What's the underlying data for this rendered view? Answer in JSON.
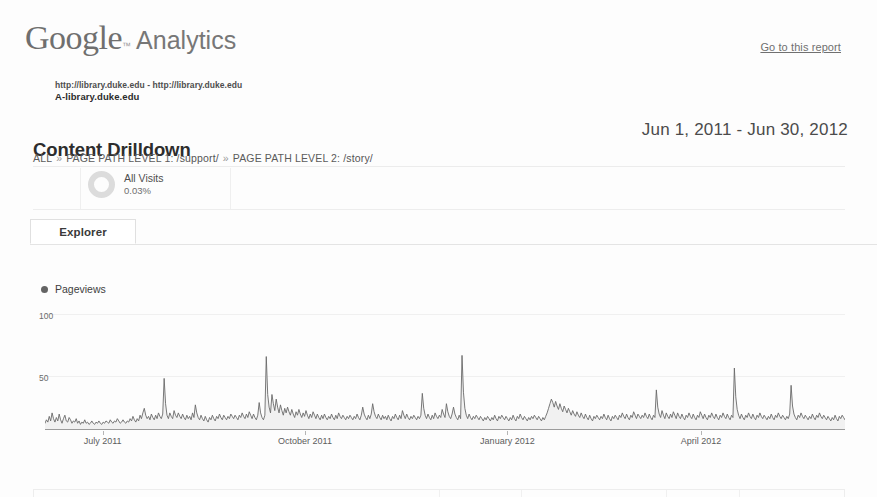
{
  "brand": {
    "logo_google": "Google",
    "logo_trademark": "™",
    "logo_product": "Analytics",
    "go_to_report_label": "Go to this report"
  },
  "property": {
    "line1": "http://library.duke.edu - http://library.duke.edu",
    "line2": "A-library.duke.edu"
  },
  "report": {
    "title": "Content Drilldown",
    "date_range": "Jun 1, 2011 - Jun 30, 2012"
  },
  "breadcrumb": {
    "root": "ALL",
    "separator": "»",
    "items": [
      {
        "label": "PAGE PATH LEVEL 1:",
        "value": "/support/"
      },
      {
        "label": "PAGE PATH LEVEL 2:",
        "value": "/story/"
      }
    ]
  },
  "segment": {
    "icon": "donut-chart-icon",
    "name": "All Visits",
    "percent": "0.03%"
  },
  "tabs": [
    {
      "label": "Explorer",
      "active": true
    }
  ],
  "chart_data": {
    "type": "line",
    "title": "",
    "subtitle": "",
    "xlabel": "",
    "ylabel": "",
    "legend": [
      {
        "name": "Pageviews",
        "color": "#646464"
      }
    ],
    "legend_position": "top-left",
    "grid": true,
    "ylim": [
      0,
      100
    ],
    "yticks": [
      50,
      100
    ],
    "ytick_labels": [
      "50",
      "100"
    ],
    "xtick_labels": [
      "July 2011",
      "October 2011",
      "January 2012",
      "April 2012"
    ],
    "xtick_positions": [
      0.072,
      0.325,
      0.578,
      0.82
    ],
    "x_start": "Jun 1, 2011",
    "x_end": "Jun 30, 2012",
    "x_interval": "daily",
    "series": [
      {
        "name": "Pageviews",
        "color": "#646464",
        "fill": "#f0f0f0",
        "values": [
          5,
          8,
          6,
          11,
          7,
          14,
          9,
          6,
          10,
          7,
          13,
          8,
          5,
          9,
          12,
          7,
          6,
          10,
          8,
          5,
          7,
          6,
          9,
          5,
          7,
          4,
          6,
          5,
          8,
          5,
          6,
          4,
          5,
          7,
          5,
          4,
          6,
          5,
          7,
          5,
          4,
          6,
          5,
          7,
          6,
          5,
          8,
          6,
          5,
          7,
          6,
          9,
          7,
          5,
          6,
          8,
          6,
          5,
          7,
          6,
          9,
          7,
          11,
          8,
          6,
          9,
          7,
          12,
          9,
          14,
          18,
          12,
          9,
          11,
          8,
          13,
          10,
          8,
          12,
          9,
          14,
          11,
          9,
          13,
          44,
          22,
          12,
          9,
          14,
          11,
          9,
          16,
          12,
          10,
          14,
          11,
          9,
          13,
          10,
          8,
          12,
          9,
          11,
          8,
          14,
          10,
          21,
          14,
          10,
          8,
          12,
          9,
          7,
          11,
          8,
          6,
          10,
          8,
          12,
          9,
          7,
          11,
          9,
          13,
          10,
          8,
          12,
          10,
          8,
          11,
          9,
          13,
          11,
          9,
          12,
          10,
          8,
          12,
          10,
          14,
          11,
          9,
          13,
          10,
          15,
          12,
          9,
          13,
          10,
          8,
          12,
          23,
          14,
          10,
          8,
          12,
          63,
          30,
          19,
          14,
          30,
          22,
          16,
          26,
          19,
          14,
          21,
          16,
          12,
          18,
          14,
          19,
          15,
          12,
          17,
          13,
          10,
          15,
          12,
          17,
          13,
          10,
          14,
          11,
          16,
          12,
          9,
          13,
          10,
          15,
          12,
          9,
          13,
          10,
          8,
          12,
          9,
          13,
          10,
          8,
          11,
          9,
          13,
          10,
          8,
          12,
          9,
          14,
          11,
          9,
          12,
          10,
          8,
          11,
          9,
          12,
          10,
          8,
          11,
          9,
          13,
          10,
          8,
          12,
          19,
          13,
          10,
          8,
          12,
          9,
          13,
          22,
          15,
          11,
          9,
          13,
          10,
          8,
          12,
          9,
          11,
          8,
          12,
          9,
          7,
          11,
          9,
          13,
          10,
          8,
          12,
          9,
          16,
          12,
          9,
          13,
          10,
          8,
          11,
          9,
          12,
          10,
          8,
          11,
          9,
          12,
          31,
          18,
          12,
          9,
          13,
          10,
          8,
          12,
          9,
          14,
          11,
          9,
          12,
          10,
          17,
          13,
          10,
          22,
          15,
          11,
          9,
          13,
          19,
          13,
          10,
          8,
          12,
          9,
          64,
          32,
          18,
          12,
          9,
          13,
          10,
          8,
          11,
          9,
          12,
          10,
          8,
          11,
          9,
          7,
          10,
          8,
          11,
          9,
          7,
          10,
          8,
          12,
          9,
          7,
          11,
          9,
          12,
          10,
          8,
          11,
          9,
          7,
          10,
          8,
          12,
          9,
          7,
          11,
          9,
          13,
          10,
          8,
          11,
          9,
          7,
          10,
          8,
          11,
          9,
          12,
          10,
          8,
          11,
          9,
          7,
          10,
          8,
          11,
          14,
          18,
          22,
          26,
          23,
          19,
          24,
          20,
          17,
          22,
          18,
          15,
          20,
          17,
          14,
          18,
          15,
          12,
          16,
          13,
          11,
          15,
          12,
          10,
          14,
          11,
          9,
          13,
          10,
          8,
          12,
          9,
          7,
          11,
          9,
          12,
          10,
          8,
          11,
          9,
          13,
          10,
          8,
          12,
          9,
          7,
          11,
          9,
          12,
          10,
          8,
          12,
          10,
          14,
          11,
          9,
          13,
          10,
          8,
          12,
          10,
          15,
          12,
          9,
          13,
          11,
          9,
          12,
          10,
          14,
          11,
          9,
          13,
          10,
          8,
          12,
          10,
          34,
          19,
          13,
          10,
          16,
          12,
          9,
          14,
          11,
          9,
          13,
          10,
          15,
          12,
          9,
          14,
          11,
          9,
          13,
          10,
          8,
          12,
          10,
          14,
          11,
          9,
          13,
          10,
          8,
          12,
          10,
          15,
          12,
          9,
          13,
          10,
          8,
          12,
          10,
          14,
          11,
          9,
          13,
          10,
          8,
          12,
          10,
          14,
          11,
          9,
          13,
          10,
          8,
          12,
          10,
          53,
          28,
          17,
          12,
          9,
          13,
          10,
          8,
          12,
          10,
          14,
          11,
          9,
          13,
          10,
          8,
          12,
          10,
          14,
          11,
          9,
          12,
          10,
          8,
          11,
          9,
          13,
          10,
          8,
          12,
          10,
          14,
          11,
          9,
          12,
          10,
          8,
          11,
          9,
          13,
          38,
          20,
          13,
          10,
          8,
          12,
          10,
          14,
          11,
          9,
          12,
          10,
          8,
          11,
          9,
          13,
          10,
          8,
          12,
          10,
          14,
          11,
          9,
          12,
          10,
          8,
          11,
          9,
          7,
          10,
          8,
          12,
          9,
          7,
          11,
          9,
          12,
          10,
          8
        ]
      }
    ]
  },
  "bottom_table": {
    "visible_portion": "header-border-only"
  }
}
